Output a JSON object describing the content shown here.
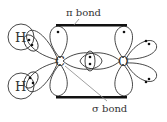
{
  "diagram": {
    "atoms": [
      {
        "id": "H1",
        "label": "H"
      },
      {
        "id": "H2",
        "label": "H"
      },
      {
        "id": "C",
        "label": "C"
      },
      {
        "id": "O",
        "label": "O"
      }
    ],
    "labels": {
      "pi_bond": "π bond",
      "sigma_bond": "σ bond"
    },
    "colors": {
      "stroke": "#333333",
      "bond_bar": "#111111",
      "pointer": "#888888"
    }
  }
}
